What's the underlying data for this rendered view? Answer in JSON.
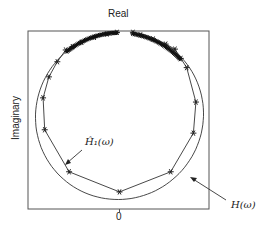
{
  "chart_data": {
    "type": "line",
    "title": "",
    "xlabel": "0",
    "ylabel": "Imaginary",
    "top_label": "Real",
    "grid": false,
    "legend": "annotations with arrows",
    "axis_ranges": {
      "x": [
        -1.1,
        1.1
      ],
      "y": [
        -1.1,
        1.05
      ]
    },
    "series": [
      {
        "name": "H(ω)",
        "style": "smooth curve, no markers",
        "shape": "near-circular contour, center (0,0), radius ~1.0, open gap at top between x=-0.03 and x=0.16",
        "points": [
          [
            -0.03,
            1.0
          ],
          [
            -0.5,
            0.87
          ],
          [
            -0.87,
            0.5
          ],
          [
            -0.98,
            0.0
          ],
          [
            -0.87,
            -0.5
          ],
          [
            -0.5,
            -0.87
          ],
          [
            0.0,
            -1.0
          ],
          [
            0.5,
            -0.87
          ],
          [
            0.87,
            -0.5
          ],
          [
            0.98,
            0.0
          ],
          [
            0.87,
            0.5
          ],
          [
            0.5,
            0.87
          ],
          [
            0.16,
            1.0
          ]
        ]
      },
      {
        "name": "Ĥ₁(ω)",
        "style": "polyline with asterisk markers",
        "points": [
          [
            -0.03,
            0.99
          ],
          [
            -0.15,
            0.97
          ],
          [
            -0.3,
            0.93
          ],
          [
            -0.45,
            0.87
          ],
          [
            -0.56,
            0.82
          ],
          [
            -0.64,
            0.78
          ],
          [
            -0.74,
            0.64
          ],
          [
            -0.84,
            0.46
          ],
          [
            -0.91,
            0.21
          ],
          [
            -0.89,
            -0.17
          ],
          [
            -0.6,
            -0.67
          ],
          [
            0.0,
            -0.91
          ],
          [
            0.61,
            -0.67
          ],
          [
            0.88,
            -0.21
          ],
          [
            0.91,
            0.16
          ],
          [
            0.8,
            0.57
          ],
          [
            0.73,
            0.68
          ],
          [
            0.66,
            0.79
          ],
          [
            0.55,
            0.85
          ],
          [
            0.4,
            0.91
          ],
          [
            0.25,
            0.96
          ],
          [
            0.16,
            0.99
          ]
        ]
      }
    ],
    "annotations": [
      {
        "text": "Ĥ₁(ω)",
        "arrow_to": [
          -0.64,
          -0.57
        ]
      },
      {
        "text": "H(ω)",
        "arrow_to": [
          0.85,
          -0.75
        ]
      }
    ]
  },
  "labels": {
    "real": "Real",
    "imaginary": "Imaginary",
    "zero": "0",
    "h1": "Ĥ₁(ω)",
    "h": "H(ω)"
  },
  "colors": {
    "line": "#333333",
    "frame": "#555555",
    "background": "#ffffff"
  }
}
